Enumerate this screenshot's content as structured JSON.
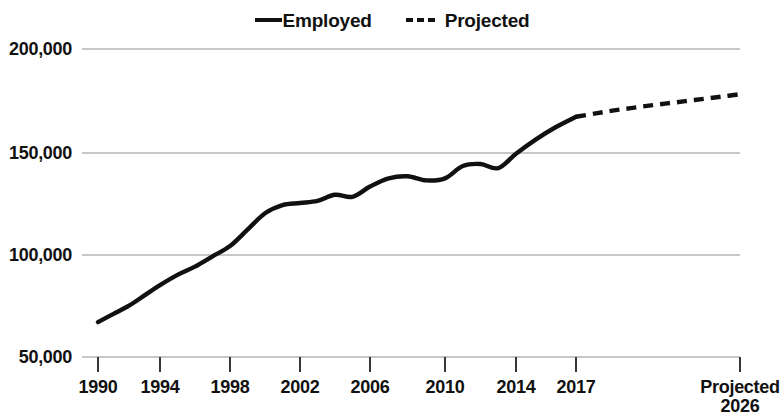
{
  "chart_data": {
    "type": "line",
    "title": "",
    "subtitle": "",
    "xlabel": "",
    "ylabel": "",
    "grid": true,
    "legend_position": "top-center",
    "ylim": [
      50000,
      200000
    ],
    "ytick_labels": [
      "200,000",
      "150,000",
      "100,000",
      "50,000"
    ],
    "ytick_values": [
      200000,
      150000,
      100000,
      50000
    ],
    "xtick_labels": [
      "1990",
      "1994",
      "1998",
      "2002",
      "2006",
      "2010",
      "2014",
      "2017",
      "Projected\n2026"
    ],
    "xtick_values": [
      1990,
      1994,
      1998,
      2002,
      2006,
      2010,
      2014,
      2017,
      2026
    ],
    "xlim": [
      1990,
      2026
    ],
    "legend": [
      {
        "name": "Employed",
        "style": "solid"
      },
      {
        "name": "Projected",
        "style": "dashed"
      }
    ],
    "series": [
      {
        "name": "Employed",
        "style": "solid",
        "x": [
          1990,
          1991,
          1992,
          1993,
          1994,
          1995,
          1996,
          1997,
          1998,
          1999,
          2000,
          2001,
          2002,
          2003,
          2004,
          2005,
          2006,
          2007,
          2008,
          2009,
          2010,
          2011,
          2012,
          2013,
          2014,
          2015,
          2016,
          2017
        ],
        "values": [
          67000,
          71000,
          75000,
          80000,
          85000,
          90000,
          94000,
          99000,
          104000,
          112000,
          120000,
          124000,
          125000,
          126000,
          129000,
          128000,
          133000,
          137000,
          138000,
          136000,
          137000,
          143000,
          144000,
          142000,
          149000,
          156000,
          162000,
          167000
        ]
      },
      {
        "name": "Projected",
        "style": "dashed",
        "x": [
          2017,
          2018,
          2019,
          2020,
          2021,
          2022,
          2023,
          2024,
          2025,
          2026
        ],
        "values": [
          167000,
          168500,
          170000,
          171200,
          172400,
          173500,
          174600,
          175700,
          176800,
          178000
        ]
      }
    ]
  },
  "legend": {
    "employed_label": "Employed",
    "projected_label": "Projected"
  },
  "axes": {
    "y_ticks": [
      {
        "label": "200,000"
      },
      {
        "label": "150,000"
      },
      {
        "label": "100,000"
      },
      {
        "label": "50,000"
      }
    ],
    "x_ticks": [
      {
        "label": "1990"
      },
      {
        "label": "1994"
      },
      {
        "label": "1998"
      },
      {
        "label": "2002"
      },
      {
        "label": "2006"
      },
      {
        "label": "2010"
      },
      {
        "label": "2014"
      },
      {
        "label": "2017"
      },
      {
        "label_line1": "Projected",
        "label_line2": "2026"
      }
    ]
  },
  "colors": {
    "series": "#111111",
    "gridline": "#b4b4b4",
    "background": "#ffffff"
  }
}
